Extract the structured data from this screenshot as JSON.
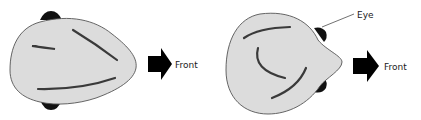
{
  "diagram": {
    "left_figure": {
      "direction_label": "Front",
      "fill_color": "#dcdcdc",
      "outline_color": "#555555",
      "eye_color": "#111111"
    },
    "right_figure": {
      "direction_label": "Front",
      "callout_label": "Eye",
      "fill_color": "#dcdcdc",
      "outline_color": "#555555",
      "eye_color": "#111111"
    },
    "arrow_color": "#000000"
  }
}
